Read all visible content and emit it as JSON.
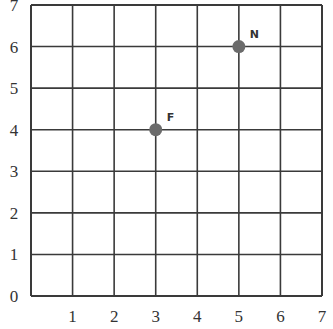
{
  "chart_data": {
    "type": "scatter",
    "title": "",
    "xlabel": "",
    "ylabel": "",
    "xlim": [
      0,
      7
    ],
    "ylim": [
      0,
      7
    ],
    "grid": true,
    "x_ticks": [
      "1",
      "2",
      "3",
      "4",
      "5",
      "6",
      "7"
    ],
    "y_ticks": [
      "0",
      "1",
      "2",
      "3",
      "4",
      "5",
      "6",
      "7"
    ],
    "points": [
      {
        "label": "F",
        "x": 3,
        "y": 4
      },
      {
        "label": "N",
        "x": 5,
        "y": 6
      }
    ],
    "colors": {
      "grid": "#3a3a3a",
      "point": "#6b6b6b",
      "text": "#333333"
    }
  }
}
